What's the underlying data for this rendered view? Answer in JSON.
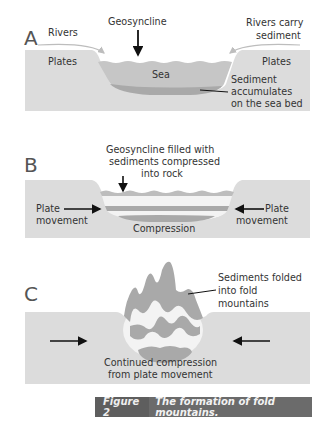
{
  "figure": {
    "number_label": "Figure 2",
    "caption": "The formation of fold mountains."
  },
  "panels": [
    {
      "letter": "A",
      "labels": {
        "geosyncline": "Geosyncline",
        "rivers": "Rivers",
        "rivers_carry_1": "Rivers carry",
        "rivers_carry_2": "sediment",
        "plates_left": "Plates",
        "plates_right": "Plates",
        "sea": "Sea",
        "sediment_1": "Sediment",
        "sediment_2": "accumulates",
        "sediment_3": "on the sea bed"
      }
    },
    {
      "letter": "B",
      "labels": {
        "geo_1": "Geosyncline filled with",
        "geo_2": "sediments compressed",
        "geo_3": "into rock",
        "plate_left_1": "Plate",
        "plate_left_2": "movement",
        "plate_right_1": "Plate",
        "plate_right_2": "movement",
        "compression": "Compression"
      }
    },
    {
      "letter": "C",
      "labels": {
        "folded_1": "Sediments folded",
        "folded_2": "into fold",
        "folded_3": "mountains",
        "continued_1": "Continued compression",
        "continued_2": "from plate movement"
      }
    }
  ],
  "colors": {
    "plate": "#dcdcdc",
    "sea": "#c6c6c6",
    "sediment": "#a9a9a9",
    "caption_bg": "#6b6b6b"
  }
}
